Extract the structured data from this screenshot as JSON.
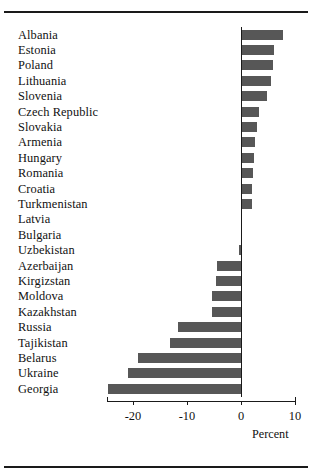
{
  "figure": {
    "axis_label": "Percent",
    "bar_color": "#575757",
    "rule_color": "#1a1a1a"
  },
  "chart_data": {
    "type": "bar",
    "orientation": "horizontal",
    "title": "",
    "subtitle": "",
    "xlabel": "Percent",
    "ylabel": "",
    "xlim": [
      -27,
      11
    ],
    "xticks": [
      -20,
      -10,
      0,
      10
    ],
    "xticklabels": [
      "-20",
      "-10",
      "0",
      "10"
    ],
    "grid": false,
    "legend": "none",
    "categories": [
      "Albania",
      "Estonia",
      "Poland",
      "Lithuania",
      "Slovenia",
      "Czech Republic",
      "Slovakia",
      "Armenia",
      "Hungary",
      "Romania",
      "Croatia",
      "Turkmenistan",
      "Latvia",
      "Bulgaria",
      "Uzbekistan",
      "Azerbaijan",
      "Kirgizstan",
      "Moldova",
      "Kazakhstan",
      "Russia",
      "Tajikistan",
      "Belarus",
      "Ukraine",
      "Georgia"
    ],
    "values": [
      7.8,
      6.2,
      5.9,
      5.5,
      4.9,
      3.3,
      3.0,
      2.6,
      2.4,
      2.2,
      2.0,
      2.0,
      0.0,
      0.0,
      -0.4,
      -4.4,
      -4.6,
      -5.4,
      -5.4,
      -11.7,
      -13.2,
      -19.0,
      -21.0,
      -24.7
    ]
  }
}
